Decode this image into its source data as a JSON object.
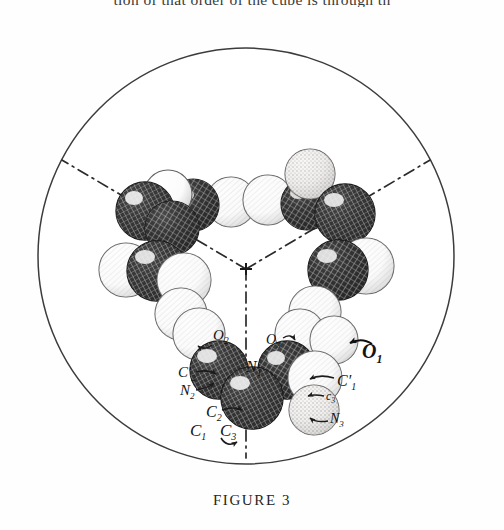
{
  "page": {
    "running_text": "tion of that order of the cube is through th",
    "background_color": "#fefefe"
  },
  "caption": {
    "text": "FIGURE 3"
  },
  "figure": {
    "kind": "molecular-model-photograph",
    "frame_shape": "circle",
    "frame_color": "#3a3a3a",
    "symmetry": "three-fold",
    "axis_style": "dash-dot",
    "axis_color": "#2b2b2b",
    "center_marker": "cross",
    "labels": [
      {
        "id": "O2",
        "text": "O",
        "sub": "2",
        "x": 222,
        "y": 317,
        "arrow": "cw-left"
      },
      {
        "id": "O3",
        "text": "O",
        "sub": "3",
        "x": 274,
        "y": 322,
        "arrow": "cw-right"
      },
      {
        "id": "O1",
        "text": "O",
        "sub": "1",
        "x": 373,
        "y": 333,
        "arrow": "bold"
      },
      {
        "id": "N1",
        "text": "N",
        "sub": "1",
        "x": 254,
        "y": 348,
        "arrow": "none"
      },
      {
        "id": "C1p",
        "text": "C′",
        "sub": "1",
        "x": 346,
        "y": 362,
        "arrow": "left"
      },
      {
        "id": "C2p",
        "text": "C′",
        "sub": "2",
        "x": 188,
        "y": 353,
        "arrow": "right"
      },
      {
        "id": "N2",
        "text": "N",
        "sub": "2",
        "x": 189,
        "y": 371,
        "arrow": "right"
      },
      {
        "id": "c3",
        "text": "c",
        "sub": "3",
        "x": 331,
        "y": 377,
        "arrow": "left"
      },
      {
        "id": "C2",
        "text": "C",
        "sub": "2",
        "x": 214,
        "y": 392,
        "arrow": "right"
      },
      {
        "id": "N3",
        "text": "N",
        "sub": "3",
        "x": 336,
        "y": 399,
        "arrow": "left"
      },
      {
        "id": "C1",
        "text": "C",
        "sub": "1",
        "x": 200,
        "y": 410,
        "arrow": "none"
      },
      {
        "id": "C3",
        "text": "C",
        "sub": "3",
        "x": 229,
        "y": 409,
        "arrow": "loop"
      }
    ],
    "atom_count": 27,
    "shading_types": [
      "dark-crosshatch",
      "light-outline",
      "stippled",
      "half-tone"
    ]
  }
}
